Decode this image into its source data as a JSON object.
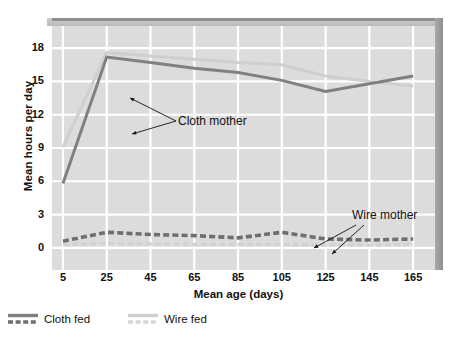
{
  "chart_data": {
    "type": "line",
    "title": "",
    "xlabel": "Mean age (days)",
    "ylabel": "Mean hours per day",
    "xlim": [
      0,
      175
    ],
    "ylim": [
      -2,
      20
    ],
    "grid": true,
    "xticks": [
      5,
      25,
      45,
      65,
      85,
      105,
      125,
      145,
      165
    ],
    "yticks": [
      0,
      3,
      6,
      9,
      12,
      15,
      18
    ],
    "x": [
      5,
      25,
      45,
      65,
      85,
      105,
      125,
      145,
      165
    ],
    "series": [
      {
        "name": "Cloth fed",
        "legend_label": "Cloth fed",
        "annotation": "Cloth mother",
        "color": "#808080",
        "style": "solid",
        "values": [
          5.8,
          17.2,
          16.7,
          16.2,
          15.8,
          15.1,
          14.1,
          14.8,
          15.5
        ]
      },
      {
        "name": "Wire fed",
        "legend_label": "Wire fed",
        "annotation": "Cloth mother",
        "color": "#cfcfcf",
        "style": "solid",
        "values": [
          9.1,
          17.6,
          17.3,
          17.0,
          16.7,
          16.5,
          15.5,
          15.0,
          14.6
        ]
      },
      {
        "name": "Cloth fed (wire mother)",
        "legend_label": "Cloth fed",
        "annotation": "Wire mother",
        "color": "#6e6e6e",
        "style": "dashed",
        "values": [
          0.6,
          1.4,
          1.2,
          1.1,
          0.9,
          1.4,
          0.8,
          0.7,
          0.8
        ]
      },
      {
        "name": "Wire fed (wire mother)",
        "legend_label": "Wire fed",
        "annotation": "Wire mother",
        "color": "#d2d2d2",
        "style": "dashed",
        "values": [
          0.3,
          0.4,
          0.35,
          0.3,
          0.3,
          0.3,
          0.25,
          0.25,
          0.3
        ]
      }
    ],
    "annotations": [
      {
        "text": "Cloth mother",
        "x_px": 126,
        "y_px": 95
      },
      {
        "text": "Wire mother",
        "x_px": 300,
        "y_px": 193
      }
    ],
    "legend": {
      "position": "below-axes",
      "entries": [
        {
          "label": "Cloth fed",
          "solid_color": "#808080",
          "dashed_color": "#6e6e6e"
        },
        {
          "label": "Wire fed",
          "solid_color": "#cfcfcf",
          "dashed_color": "#d6d6d6"
        }
      ]
    },
    "colors": {
      "plot_background": "#dcdcdc",
      "gridline": "#ffffff",
      "bevel_top": "#c4c4c4",
      "bevel_right": "#9a9a9a",
      "text": "#111111"
    }
  },
  "axes": {
    "y_title": "Mean hours per day",
    "x_title": "Mean age (days)",
    "y_ticks": [
      "18",
      "15",
      "12",
      "9",
      "6",
      "3",
      "0"
    ],
    "x_ticks": [
      "5",
      "25",
      "45",
      "65",
      "85",
      "105",
      "125",
      "145",
      "165"
    ]
  },
  "annotations": {
    "cloth_mother": "Cloth mother",
    "wire_mother": "Wire mother"
  },
  "legend": {
    "cloth_fed": "Cloth fed",
    "wire_fed": "Wire fed"
  }
}
